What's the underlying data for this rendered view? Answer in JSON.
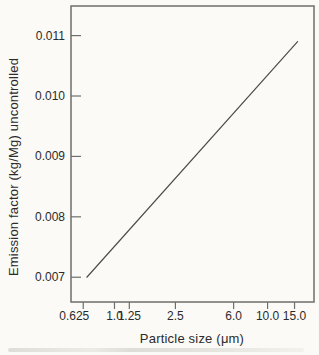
{
  "figure": {
    "background": "#fbfaf6",
    "scan_band_color": "#dcdbd6"
  },
  "chart_data": {
    "type": "line",
    "title": "",
    "xlabel": "Particle size (μm)",
    "ylabel": "Emission factor (kg/Mg) uncontrolled",
    "x_scale": "log",
    "y_scale": "linear",
    "xlim": [
      0.52,
      20.1
    ],
    "ylim": [
      0.00659,
      0.01149
    ],
    "x_tick_values": [
      0.625,
      1.0,
      1.25,
      2.5,
      6.0,
      10.0,
      15.0
    ],
    "x_tick_labels": [
      "0.625",
      "1.0",
      "1.25",
      "2.5",
      "6.0",
      "10.0",
      "15.0"
    ],
    "y_tick_values": [
      0.007,
      0.008,
      0.009,
      0.01,
      0.011
    ],
    "y_tick_labels": [
      "0.007",
      "0.008",
      "0.009",
      "0.010",
      "0.011"
    ],
    "grid": false,
    "legend": false,
    "frame": true,
    "series": [
      {
        "name": "uncontrolled-emission-factor",
        "x": [
          0.66,
          15.7
        ],
        "y": [
          0.007,
          0.0109
        ],
        "color": "#4d4d4d"
      }
    ],
    "axis_color": "#6e6e6e",
    "text_color": "#2b2b2b"
  }
}
